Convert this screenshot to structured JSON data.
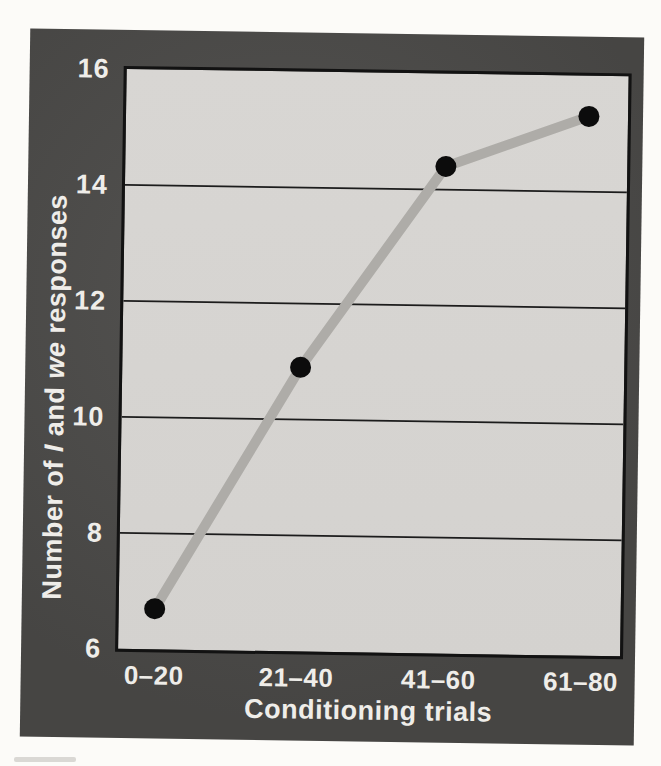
{
  "chart_data": {
    "type": "line",
    "title": "",
    "categories": [
      "0–20",
      "21–40",
      "41–60",
      "61–80"
    ],
    "values": [
      6.7,
      10.9,
      14.4,
      15.3
    ],
    "xlabel": "Conditioning trials",
    "ylabel": "Number of I and we responses",
    "ylabel_rich": [
      {
        "t": "Number of ",
        "i": false
      },
      {
        "t": "I",
        "i": true
      },
      {
        "t": " and ",
        "i": false
      },
      {
        "t": "we",
        "i": true
      },
      {
        "t": " responses",
        "i": false
      }
    ],
    "ylim": [
      6,
      16
    ],
    "yticks": [
      6,
      8,
      10,
      12,
      14,
      16
    ],
    "grid": "horizontal",
    "legend": "none"
  },
  "colors": {
    "page_bg": "#fcfbf8",
    "frame_bg": "#4b4a48",
    "plot_bg": "#d8d6d3",
    "grid_color": "#1c1c1c",
    "line_color": "#aeaca8",
    "point_color": "#0c0c0c",
    "label_color": "#efede9"
  }
}
